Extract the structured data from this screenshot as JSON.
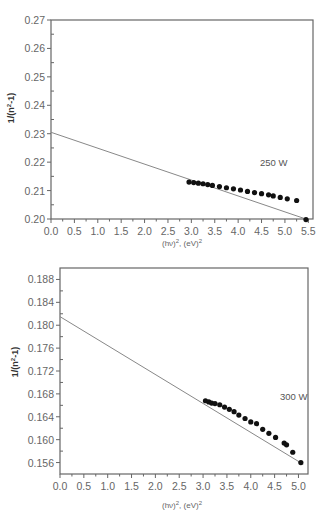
{
  "chart_data": [
    {
      "type": "scatter",
      "title": "",
      "xlabel": "(hv)^2, (eV)^2",
      "ylabel": "1/(n^2-1)",
      "xlim": [
        0.0,
        5.6
      ],
      "ylim": [
        0.2,
        0.27
      ],
      "x_ticks": [
        "0.0",
        "0.5",
        "1.0",
        "1.5",
        "2.0",
        "2.5",
        "3.0",
        "3.5",
        "4.0",
        "4.5",
        "5.0",
        "5.5"
      ],
      "y_ticks": [
        "0.20",
        "0.21",
        "0.22",
        "0.23",
        "0.24",
        "0.25",
        "0.26",
        "0.27"
      ],
      "annotation": "250 W",
      "grid": false,
      "series": [
        {
          "name": "250 W data",
          "marker": "circle",
          "x": [
            2.95,
            3.05,
            3.15,
            3.25,
            3.35,
            3.45,
            3.6,
            3.75,
            3.9,
            4.05,
            4.2,
            4.35,
            4.5,
            4.65,
            4.75,
            4.9,
            5.05,
            5.25,
            5.45
          ],
          "y": [
            0.213,
            0.2128,
            0.2126,
            0.2124,
            0.2121,
            0.2118,
            0.2114,
            0.211,
            0.2106,
            0.2102,
            0.2097,
            0.2093,
            0.2089,
            0.2085,
            0.2081,
            0.2076,
            0.2071,
            0.2065,
            0.1998
          ]
        },
        {
          "name": "linear fit",
          "type": "line",
          "x": [
            0.0,
            5.5
          ],
          "y": [
            0.2305,
            0.1997
          ]
        }
      ]
    },
    {
      "type": "scatter",
      "title": "",
      "xlabel": "(hv)^2, (eV)^2",
      "ylabel": "1/(n^2-1)",
      "xlim": [
        0.0,
        5.2
      ],
      "ylim": [
        0.154,
        0.19
      ],
      "x_ticks": [
        "0.0",
        "0.5",
        "1.0",
        "1.5",
        "2.0",
        "2.5",
        "3.0",
        "3.5",
        "4.0",
        "4.5",
        "5.0"
      ],
      "y_ticks": [
        "0.156",
        "0.160",
        "0.164",
        "0.168",
        "0.172",
        "0.176",
        "0.180",
        "0.184",
        "0.188"
      ],
      "annotation": "300 W",
      "grid": false,
      "series": [
        {
          "name": "300 W data",
          "marker": "circle",
          "x": [
            3.05,
            3.12,
            3.18,
            3.25,
            3.35,
            3.45,
            3.55,
            3.65,
            3.75,
            3.88,
            4.0,
            4.12,
            4.25,
            4.38,
            4.52,
            4.7,
            4.75,
            4.88,
            5.05
          ],
          "y": [
            0.1668,
            0.1666,
            0.1664,
            0.1663,
            0.1661,
            0.1657,
            0.1653,
            0.1649,
            0.1643,
            0.1637,
            0.1631,
            0.1628,
            0.1618,
            0.1611,
            0.1604,
            0.1594,
            0.1591,
            0.1578,
            0.156
          ]
        },
        {
          "name": "linear fit",
          "type": "line",
          "x": [
            0.0,
            5.1
          ],
          "y": [
            0.1815,
            0.1557
          ]
        }
      ]
    }
  ]
}
